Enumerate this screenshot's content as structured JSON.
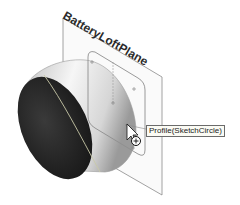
{
  "viewport": {
    "plane_label": "BatteryLoftPlane",
    "tooltip": "Profile(SketchCircle)",
    "cursor": "select-arrow-with-profile-indicator"
  },
  "colors": {
    "background": "#ffffff",
    "plane_edge": "#8a8a8a",
    "cylinder_face_dark": "#2e2e2e",
    "cylinder_body_light": "#e9e9e9",
    "sketch_profile": "#8f8f8f",
    "edge_highlight": "#c8c8a8"
  }
}
